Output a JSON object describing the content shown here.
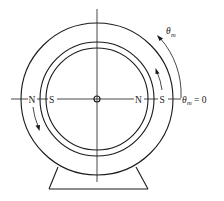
{
  "diagram": {
    "labels": {
      "stator_left_pole": "N",
      "rotor_left_pole": "S",
      "rotor_right_pole": "N",
      "stator_right_pole": "S",
      "theta_symbol": "θ",
      "theta_subscript": "m",
      "theta_zero_eq": "= 0"
    },
    "geometry": {
      "center": [
        97,
        99
      ],
      "outer_radius": 76,
      "middle_radius": 57,
      "inner_radius": 51,
      "hub_radius": 3
    },
    "arrows": [
      {
        "name": "theta-m-direction-arrow",
        "direction": "counterclockwise"
      },
      {
        "name": "rotor-rotation-arrow-right",
        "direction": "counterclockwise"
      },
      {
        "name": "rotor-rotation-arrow-left",
        "direction": "counterclockwise"
      }
    ],
    "colors": {
      "line": "#1a1a1a",
      "background": "#ffffff"
    }
  }
}
